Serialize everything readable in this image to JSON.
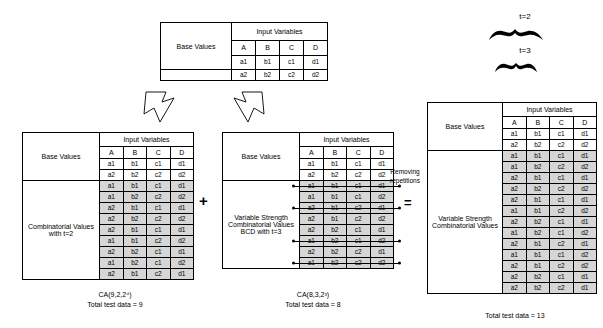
{
  "diagram": {
    "headers": {
      "input_variables": "Input Variables",
      "base_values": "Base Values",
      "columns": [
        "A",
        "B",
        "C",
        "D"
      ]
    },
    "base_rows": [
      [
        "a1",
        "b1",
        "c1",
        "d1"
      ],
      [
        "a2",
        "b2",
        "c2",
        "d2"
      ]
    ],
    "top_table": {
      "label": "Base Values",
      "header": "Input Variables",
      "columns": [
        "A",
        "B",
        "C",
        "D"
      ],
      "rows": [
        [
          "a1",
          "b1",
          "c1",
          "d1"
        ],
        [
          "a2",
          "b2",
          "c2",
          "d2"
        ]
      ]
    },
    "left_table": {
      "base_label": "Base Values",
      "body_label": "Combinatorial Values with t=2",
      "header": "Input Variables",
      "columns": [
        "A",
        "B",
        "C",
        "D"
      ],
      "base_rows": [
        [
          "a1",
          "b1",
          "c1",
          "d1"
        ],
        [
          "a2",
          "b2",
          "c2",
          "d2"
        ]
      ],
      "value_rows": [
        [
          "a1",
          "b1",
          "c1",
          "d1"
        ],
        [
          "a1",
          "b2",
          "c2",
          "d2"
        ],
        [
          "a2",
          "b1",
          "c1",
          "d1"
        ],
        [
          "a2",
          "b2",
          "c2",
          "d2"
        ],
        [
          "a2",
          "b1",
          "c1",
          "d1"
        ],
        [
          "a1",
          "b1",
          "c2",
          "d2"
        ],
        [
          "a2",
          "b2",
          "c1",
          "d1"
        ],
        [
          "a1",
          "b2",
          "c1",
          "d2"
        ],
        [
          "a2",
          "b1",
          "c2",
          "d1"
        ]
      ],
      "caption_line1": "CA(9,2,2⁴)",
      "caption_line2": "Total test data = 9"
    },
    "mid_table": {
      "base_label": "Base Values",
      "body_label": "Variable Strength Combinatorial Values BCD with t=3",
      "header": "Input Variables",
      "columns": [
        "A",
        "B",
        "C",
        "D"
      ],
      "base_rows": [
        [
          "a1",
          "b1",
          "c1",
          "d1"
        ],
        [
          "a2",
          "b2",
          "c2",
          "d2"
        ]
      ],
      "value_rows": [
        {
          "cells": [
            "a1",
            "b1",
            "c1",
            "d1"
          ],
          "removed": true
        },
        {
          "cells": [
            "a1",
            "b1",
            "c1",
            "d2"
          ],
          "removed": false
        },
        {
          "cells": [
            "a2",
            "b1",
            "c2",
            "d1"
          ],
          "removed": true
        },
        {
          "cells": [
            "a2",
            "b1",
            "c2",
            "d2"
          ],
          "removed": false
        },
        {
          "cells": [
            "a2",
            "b2",
            "c1",
            "d1"
          ],
          "removed": false
        },
        {
          "cells": [
            "a1",
            "b2",
            "c1",
            "d2"
          ],
          "removed": true
        },
        {
          "cells": [
            "a2",
            "b2",
            "c2",
            "d1"
          ],
          "removed": false
        },
        {
          "cells": [
            "a1",
            "b2",
            "c2",
            "d2"
          ],
          "removed": true
        }
      ],
      "caption_line1": "CA(8,3,2³)",
      "caption_line2": "Total test data = 8"
    },
    "right_table": {
      "base_label": "Base Values",
      "body_label": "Variable Strength Combinatorial Values",
      "header": "Input Variables",
      "columns": [
        "A",
        "B",
        "C",
        "D"
      ],
      "base_rows": [
        [
          "a1",
          "b1",
          "c1",
          "d1"
        ],
        [
          "a2",
          "b2",
          "c2",
          "d2"
        ]
      ],
      "value_rows": [
        [
          "a1",
          "b1",
          "c1",
          "d1"
        ],
        [
          "a1",
          "b2",
          "c2",
          "d2"
        ],
        [
          "a2",
          "b1",
          "c1",
          "d1"
        ],
        [
          "a2",
          "b2",
          "c2",
          "d2"
        ],
        [
          "a2",
          "b1",
          "c1",
          "d1"
        ],
        [
          "a1",
          "b1",
          "c2",
          "d2"
        ],
        [
          "a2",
          "b2",
          "c1",
          "d1"
        ],
        [
          "a1",
          "b2",
          "c1",
          "d2"
        ],
        [
          "a2",
          "b1",
          "c2",
          "d1"
        ],
        [
          "a1",
          "b1",
          "c1",
          "d2"
        ],
        [
          "a2",
          "b1",
          "c2",
          "d2"
        ],
        [
          "a2",
          "b2",
          "c1",
          "d1"
        ],
        [
          "a2",
          "b2",
          "c2",
          "d1"
        ]
      ],
      "caption_line2": "Total test data = 13"
    },
    "annotations": {
      "plus": "+",
      "equals": "=",
      "removing_repetitions": "Removing repetitions",
      "t2": "t=2",
      "t3": "t=3"
    }
  }
}
